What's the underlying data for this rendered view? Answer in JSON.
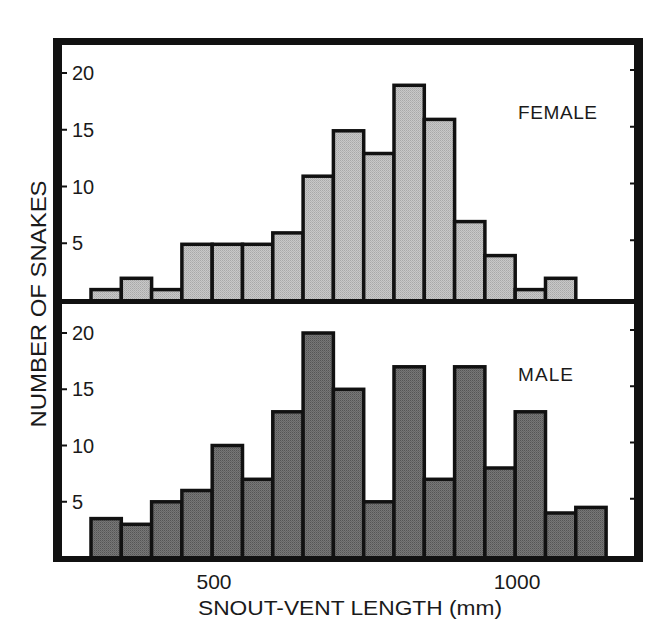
{
  "chart_data": {
    "type": "bar",
    "title": "",
    "xlabel": "SNOUT-VENT LENGTH (mm)",
    "ylabel": "NUMBER OF SNAKES",
    "x_ticks": [
      500,
      1000
    ],
    "x_tick_labels": [
      "500",
      "1000"
    ],
    "y_ticks": [
      5,
      10,
      15,
      20
    ],
    "y_tick_labels": [
      "5",
      "10",
      "15",
      "20"
    ],
    "ylim": [
      0,
      22
    ],
    "bin_width_mm": 50,
    "grid": false,
    "legend": "none",
    "panels": [
      {
        "name": "FEMALE",
        "label": "FEMALE",
        "fill_color": "#c0c0c0",
        "bin_starts_mm": [
          300,
          350,
          400,
          450,
          500,
          550,
          600,
          650,
          700,
          750,
          800,
          850,
          900,
          950,
          1000,
          1050
        ],
        "values": [
          1,
          2,
          1,
          5,
          5,
          5,
          6,
          11,
          15,
          13,
          19,
          16,
          7,
          4,
          1,
          2
        ]
      },
      {
        "name": "MALE",
        "label": "MALE",
        "fill_color": "#6e6e6e",
        "bin_starts_mm": [
          300,
          350,
          400,
          450,
          500,
          550,
          600,
          650,
          700,
          750,
          800,
          850,
          900,
          950,
          1000,
          1050,
          1100
        ],
        "values": [
          3.5,
          3,
          5,
          6,
          10,
          7,
          13,
          20,
          15,
          5,
          17,
          7,
          17,
          8,
          13,
          4,
          4.5
        ]
      }
    ]
  },
  "labels": {
    "female": "FEMALE",
    "male": "MALE",
    "x_axis": "SNOUT-VENT LENGTH (mm)",
    "y_axis": "NUMBER OF SNAKES",
    "x_tick_500": "500",
    "x_tick_1000": "1000"
  }
}
